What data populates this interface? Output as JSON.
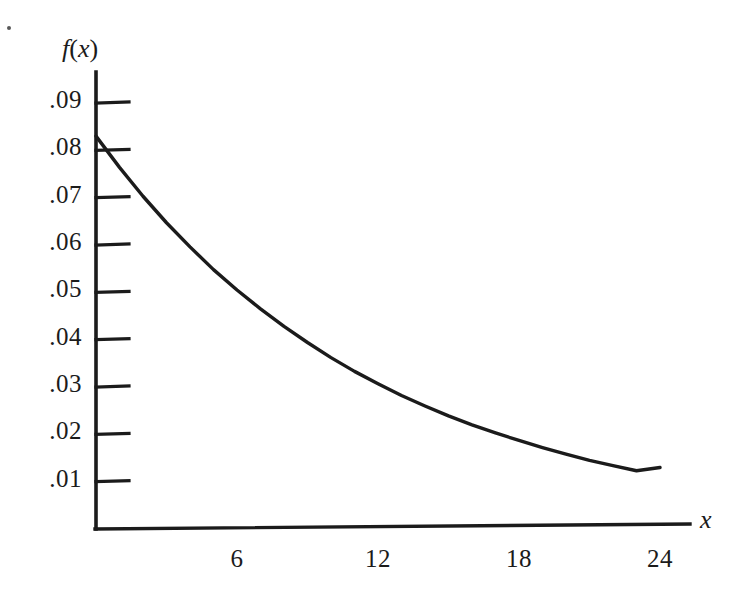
{
  "figure": {
    "background_color": "#ffffff",
    "ink_color": "#1b1b1b",
    "artifact_speck": "scan-speck"
  },
  "axes": {
    "y_axis_title": "f(x)",
    "y_axis_title_parts": {
      "func": "f",
      "open": "(",
      "var": "x",
      "close": ")"
    },
    "x_axis_title": "x",
    "y_tick_labels": [
      ".09",
      ".08",
      ".07",
      ".06",
      ".05",
      ".04",
      ".03",
      ".02",
      ".01"
    ],
    "y_tick_values": [
      0.09,
      0.08,
      0.07,
      0.06,
      0.05,
      0.04,
      0.03,
      0.02,
      0.01
    ],
    "x_tick_labels": [
      "6",
      "12",
      "18",
      "24"
    ],
    "x_tick_values": [
      6,
      12,
      18,
      24
    ]
  },
  "chart_data": {
    "type": "line",
    "title": "",
    "subtitle": "",
    "xlabel": "x",
    "ylabel": "f(x)",
    "xlim": [
      0,
      26
    ],
    "ylim": [
      0,
      0.1
    ],
    "grid": false,
    "legend": null,
    "x_ticks": [
      6,
      12,
      18,
      24
    ],
    "y_ticks": [
      0.01,
      0.02,
      0.03,
      0.04,
      0.05,
      0.06,
      0.07,
      0.08,
      0.09
    ],
    "annotations": [],
    "series": [
      {
        "name": "f(x)",
        "x": [
          0,
          1,
          2,
          3,
          4,
          5,
          6,
          7,
          8,
          9,
          10,
          11,
          12,
          13,
          14,
          15,
          16,
          17,
          18,
          19,
          20,
          21,
          22,
          23,
          24
        ],
        "values": [
          0.083,
          0.0764,
          0.0703,
          0.0647,
          0.0596,
          0.0548,
          0.0505,
          0.0465,
          0.0428,
          0.0394,
          0.0362,
          0.0333,
          0.0307,
          0.0282,
          0.026,
          0.0239,
          0.022,
          0.0203,
          0.0187,
          0.0172,
          0.0158,
          0.0145,
          0.0134,
          0.0123,
          0.013
        ]
      }
    ]
  }
}
